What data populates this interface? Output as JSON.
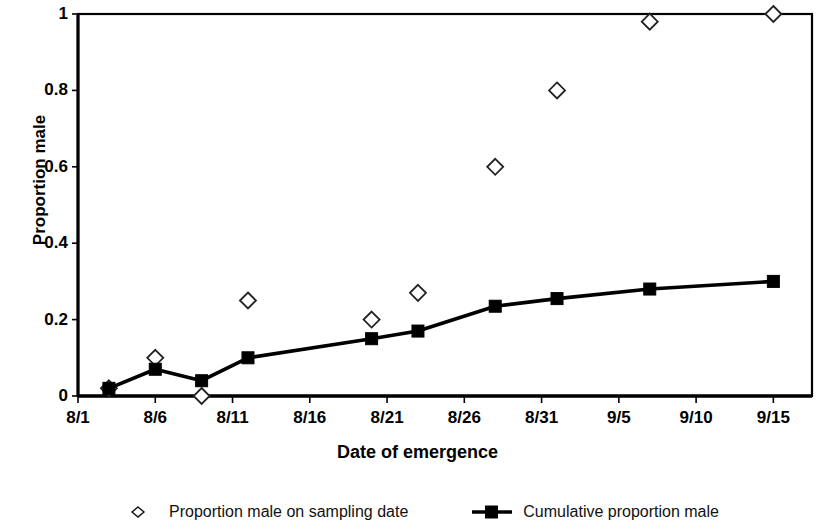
{
  "chart_data": {
    "type": "scatter",
    "title": "",
    "xlabel": "Date of emergence",
    "ylabel": "Proportion male",
    "ylim": [
      0,
      1
    ],
    "yticks": [
      "0",
      "0.2",
      "0.4",
      "0.6",
      "0.8",
      "1"
    ],
    "ytick_values": [
      0,
      0.2,
      0.4,
      0.6,
      0.8,
      1
    ],
    "xticks": [
      "8/1",
      "8/6",
      "8/11",
      "8/16",
      "8/21",
      "8/26",
      "8/31",
      "9/5",
      "9/10",
      "9/15"
    ],
    "xtick_values": [
      0,
      5,
      10,
      15,
      20,
      25,
      30,
      35,
      40,
      45
    ],
    "xlim": [
      0,
      47.5
    ],
    "grid": false,
    "legend_position": "bottom",
    "series": [
      {
        "name": "Proportion male on sampling date",
        "marker": "open-diamond",
        "line": false,
        "x": [
          2,
          5,
          8,
          11,
          19,
          22,
          27,
          31,
          37,
          45
        ],
        "values": [
          0.02,
          0.1,
          0.0,
          0.25,
          0.2,
          0.27,
          0.6,
          0.8,
          0.98,
          1.0
        ]
      },
      {
        "name": "Cumulative proportion male",
        "marker": "filled-square",
        "line": true,
        "x": [
          2,
          5,
          8,
          11,
          19,
          22,
          27,
          31,
          37,
          45
        ],
        "values": [
          0.02,
          0.07,
          0.04,
          0.1,
          0.15,
          0.17,
          0.235,
          0.255,
          0.28,
          0.3
        ]
      }
    ]
  },
  "axes": {
    "y_title": "Proportion male",
    "x_title": "Date of emergence"
  },
  "legend": {
    "items": [
      {
        "label": "Proportion male on sampling date",
        "marker": "open-diamond"
      },
      {
        "label": "Cumulative proportion male",
        "marker": "filled-square-line"
      }
    ]
  },
  "colors": {
    "foreground": "#000000",
    "background": "#ffffff"
  }
}
